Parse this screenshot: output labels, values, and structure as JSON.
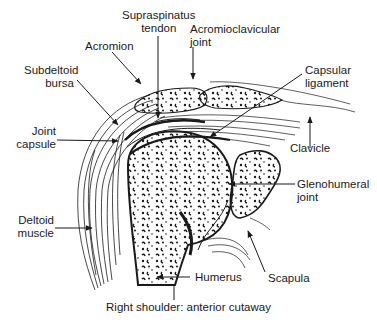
{
  "figure": {
    "caption": "Right shoulder: anterior cutaway",
    "labels": {
      "supraspinatus_tendon": {
        "line1": "Supraspinatus",
        "line2": "tendon"
      },
      "acromion": {
        "line1": "Acromion"
      },
      "acromioclavicular_joint": {
        "line1": "Acromioclavicular",
        "line2": "joint"
      },
      "subdeltoid_bursa": {
        "line1": "Subdeltoid",
        "line2": "bursa"
      },
      "capsular_ligament": {
        "line1": "Capsular",
        "line2": "ligament"
      },
      "joint_capsule": {
        "line1": "Joint",
        "line2": "capsule"
      },
      "clavicle": {
        "line1": "Clavicle"
      },
      "glenohumeral_joint": {
        "line1": "Glenohumeral",
        "line2": "joint"
      },
      "deltoid_muscle": {
        "line1": "Deltoid",
        "line2": "muscle"
      },
      "humerus": {
        "line1": "Humerus"
      },
      "scapula": {
        "line1": "Scapula"
      }
    },
    "colors": {
      "ink": "#1a1a1a",
      "background": "#ffffff"
    }
  }
}
